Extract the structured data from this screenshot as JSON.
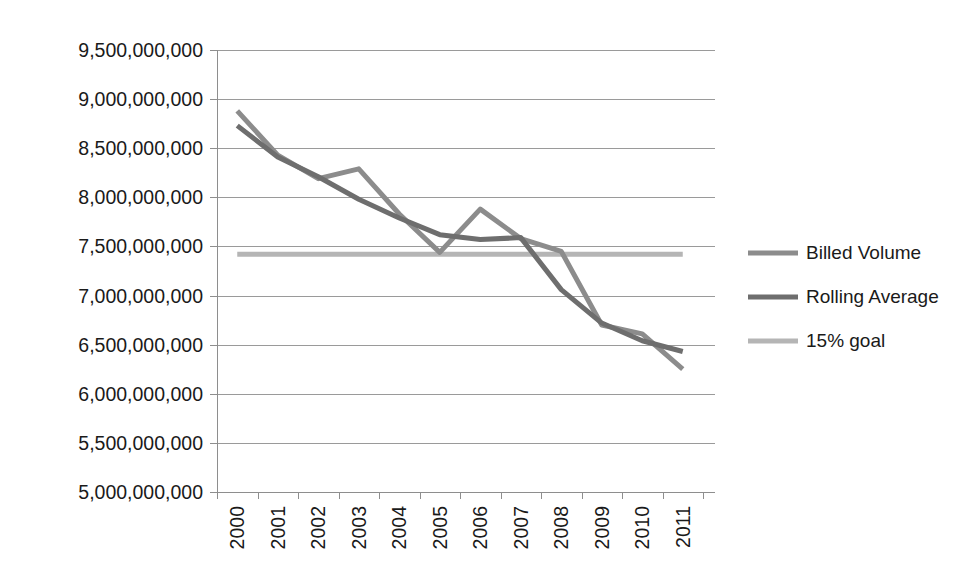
{
  "chart_data": {
    "type": "line",
    "title": "",
    "xlabel": "",
    "ylabel": "",
    "categories": [
      "2000",
      "2001",
      "2002",
      "2003",
      "2004",
      "2005",
      "2006",
      "2007",
      "2008",
      "2009",
      "2010",
      "2011"
    ],
    "ylim": [
      5000000000,
      9500000000
    ],
    "ytick_step": 500000000,
    "ytick_labels": [
      "9,500,000,000",
      "9,000,000,000",
      "8,500,000,000",
      "8,000,000,000",
      "7,500,000,000",
      "7,000,000,000",
      "6,500,000,000",
      "6,000,000,000",
      "5,500,000,000",
      "5,000,000,000"
    ],
    "ytick_values": [
      9500000000,
      9000000000,
      8500000000,
      8000000000,
      7500000000,
      7000000000,
      6500000000,
      6000000000,
      5500000000,
      5000000000
    ],
    "grid": true,
    "legend_position": "right",
    "series": [
      {
        "name": "Billed Volume",
        "color": "#8c8c8c",
        "stroke_width": 5,
        "values": [
          8880000000,
          8430000000,
          8190000000,
          8290000000,
          7830000000,
          7440000000,
          7880000000,
          7580000000,
          7450000000,
          6700000000,
          6610000000,
          6250000000
        ]
      },
      {
        "name": "Rolling Average",
        "color": "#6e6e6e",
        "stroke_width": 5,
        "values": [
          8730000000,
          8410000000,
          8210000000,
          7980000000,
          7790000000,
          7620000000,
          7570000000,
          7590000000,
          7060000000,
          6720000000,
          6540000000,
          6430000000
        ]
      },
      {
        "name": "15% goal",
        "color": "#b5b5b5",
        "stroke_width": 5,
        "constant": 7420000000,
        "values": [
          7420000000,
          7420000000,
          7420000000,
          7420000000,
          7420000000,
          7420000000,
          7420000000,
          7420000000,
          7420000000,
          7420000000,
          7420000000,
          7420000000
        ]
      }
    ],
    "legend": [
      {
        "label": "Billed Volume",
        "color": "#8c8c8c"
      },
      {
        "label": "Rolling Average",
        "color": "#6e6e6e"
      },
      {
        "label": "15% goal",
        "color": "#b5b5b5"
      }
    ]
  },
  "layout": {
    "plot_left": 217,
    "plot_right": 703,
    "plot_top": 50,
    "plot_bottom": 492,
    "legend_x_line_start": 748,
    "legend_x_line_end": 798,
    "legend_x_text": 806,
    "legend_y_start": 253,
    "legend_y_step": 44
  }
}
